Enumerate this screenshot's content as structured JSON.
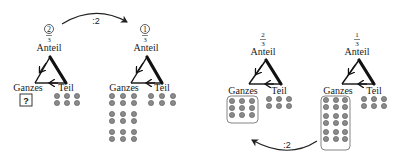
{
  "diagram": {
    "colors": {
      "stroke": "#111111",
      "dot_fill": "#8a8a8a",
      "dot_stroke": "#555555",
      "box_stroke": "#777777",
      "arrow": "#222222"
    },
    "top_arrow": {
      "label": ":2",
      "from_panel": 1,
      "to_panel": 2
    },
    "bottom_arrow": {
      "label": ":2",
      "from_panel": 4,
      "to_panel": 3
    },
    "panels": [
      {
        "id": 1,
        "anteil_label": "Anteil",
        "numerator": "2",
        "numerator_circled": true,
        "denominator": "3",
        "ganzes_label": "Ganzes",
        "teil_label": "Teil",
        "ganzes_value": "?",
        "ganzes_dots": 0,
        "teil_dots": 6
      },
      {
        "id": 2,
        "anteil_label": "Anteil",
        "numerator": "1",
        "numerator_circled": true,
        "denominator": "3",
        "ganzes_label": "Ganzes",
        "teil_label": "Teil",
        "ganzes_dots": 18,
        "teil_dots": 6
      },
      {
        "id": 3,
        "anteil_label": "Anteil",
        "numerator": "2",
        "numerator_circled": false,
        "denominator": "3",
        "ganzes_label": "Ganzes",
        "teil_label": "Teil",
        "ganzes_dots": 9,
        "ganzes_boxed": true,
        "teil_dots": 6
      },
      {
        "id": 4,
        "anteil_label": "Anteil",
        "numerator": "1",
        "numerator_circled": false,
        "denominator": "3",
        "ganzes_label": "Ganzes",
        "teil_label": "Teil",
        "ganzes_dots": 18,
        "ganzes_boxed": true,
        "teil_dots": 6
      }
    ]
  }
}
